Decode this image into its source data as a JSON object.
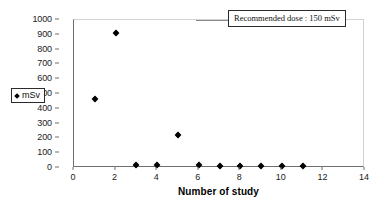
{
  "chart_data": {
    "type": "scatter",
    "title": "",
    "xlabel": "Number of study",
    "ylabel": "",
    "xlim": [
      0,
      14
    ],
    "ylim": [
      0,
      1000
    ],
    "grid": false,
    "legend_position": "left-outside",
    "series": [
      {
        "name": "mSv",
        "marker": "diamond",
        "color": "#000000",
        "points": [
          {
            "x": 1,
            "y": 450
          },
          {
            "x": 2,
            "y": 900
          },
          {
            "x": 3,
            "y": 5
          },
          {
            "x": 4,
            "y": 5
          },
          {
            "x": 5,
            "y": 210
          },
          {
            "x": 6,
            "y": 5
          },
          {
            "x": 7,
            "y": 3
          },
          {
            "x": 8,
            "y": 3
          },
          {
            "x": 9,
            "y": 2
          },
          {
            "x": 10,
            "y": 2
          },
          {
            "x": 11,
            "y": 2
          }
        ]
      }
    ],
    "x_ticks": [
      0,
      2,
      4,
      6,
      8,
      10,
      12,
      14
    ],
    "y_ticks": [
      0,
      100,
      200,
      300,
      400,
      500,
      600,
      700,
      800,
      900,
      1000
    ],
    "annotations": [
      {
        "text": "Recommended dose : 150 mSv",
        "has_leader_line": true
      }
    ]
  },
  "legend": {
    "entries": [
      {
        "label": "mSv",
        "marker": "diamond-marker-icon"
      }
    ]
  },
  "axes": {
    "x_title": "Number of study"
  },
  "annotation": {
    "text": "Recommended dose : 150 mSv"
  }
}
